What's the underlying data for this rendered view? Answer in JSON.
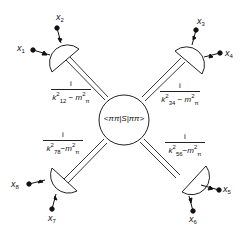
{
  "diagram": {
    "central_blob": {
      "label": "<ππ|S|ππ>"
    },
    "external_points": [
      {
        "label": "x",
        "index": "1"
      },
      {
        "label": "x",
        "index": "2"
      },
      {
        "label": "x",
        "index": "3"
      },
      {
        "label": "x",
        "index": "4"
      },
      {
        "label": "x",
        "index": "5"
      },
      {
        "label": "x",
        "index": "6"
      },
      {
        "label": "x",
        "index": "7"
      },
      {
        "label": "x",
        "index": "8"
      }
    ],
    "propagators": [
      {
        "position": "top-left",
        "numerator": "i",
        "k": "k",
        "k_sub": "12",
        "minus": "−",
        "m": "m",
        "m_sub": "π",
        "power": "2"
      },
      {
        "position": "top-right",
        "numerator": "i",
        "k": "k",
        "k_sub": "34",
        "minus": "−",
        "m": "m",
        "m_sub": "π",
        "power": "2"
      },
      {
        "position": "bottom-left",
        "numerator": "i",
        "k": "k",
        "k_sub": "78",
        "minus": "−",
        "m": "m",
        "m_sub": "π",
        "power": "2"
      },
      {
        "position": "bottom-right",
        "numerator": "i",
        "k": "k",
        "k_sub": "56",
        "minus": "−",
        "m": "m",
        "m_sub": "π",
        "power": "2"
      }
    ],
    "colors": {
      "ink": "#111111",
      "background": "#ffffff"
    }
  }
}
